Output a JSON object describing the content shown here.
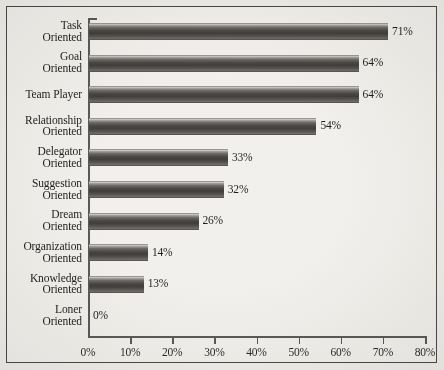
{
  "chart_data": {
    "type": "bar",
    "orientation": "horizontal",
    "title": "",
    "subtitle": "",
    "xlabel": "",
    "ylabel": "",
    "xlim": [
      0,
      80
    ],
    "grid": false,
    "legend": null,
    "categories": [
      "Task\nOriented",
      "Goal\nOriented",
      "Team Player",
      "Relationship\nOriented",
      "Delegator\nOriented",
      "Suggestion\nOriented",
      "Dream\nOriented",
      "Organization\nOriented",
      "Knowledge\nOriented",
      "Loner\nOriented"
    ],
    "values": [
      71,
      64,
      64,
      54,
      33,
      32,
      26,
      14,
      13,
      0
    ],
    "value_labels": [
      "71%",
      "64%",
      "64%",
      "54%",
      "33%",
      "32%",
      "26%",
      "14%",
      "13%",
      "0%"
    ],
    "x_ticks": [
      0,
      10,
      20,
      30,
      40,
      50,
      60,
      70,
      80
    ],
    "x_tick_labels": [
      "0%",
      "10%",
      "20%",
      "30%",
      "40%",
      "50%",
      "60%",
      "70%",
      "80%"
    ],
    "bar_color": "#4a4744",
    "axis_color": "#5a5a5a",
    "background_color": "#f1f0ec",
    "frame_color": "#4a4a4a"
  }
}
